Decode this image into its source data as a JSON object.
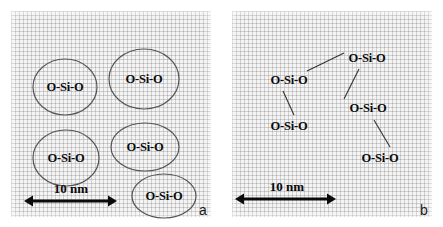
{
  "figure": {
    "panels": [
      {
        "id": "a",
        "letter": "a",
        "letter_pos": {
          "x": 188,
          "y": 192
        },
        "type": "clustered-aggregates",
        "scalebar": {
          "label": "10 nm",
          "x1": 13,
          "x2": 106,
          "y": 190,
          "text_x": 60,
          "text_y": 170
        },
        "ellipses": [
          {
            "label": "O-Si-O",
            "cx": 54,
            "cy": 76,
            "rx": 32,
            "ry": 28
          },
          {
            "label": "O-Si-O",
            "cx": 133,
            "cy": 68,
            "rx": 35,
            "ry": 30
          },
          {
            "label": "O-Si-O",
            "cx": 55,
            "cy": 147,
            "rx": 33,
            "ry": 28
          },
          {
            "label": "O-Si-O",
            "cx": 134,
            "cy": 136,
            "rx": 34,
            "ry": 24
          },
          {
            "label": "O-Si-O",
            "cx": 153,
            "cy": 185,
            "rx": 32,
            "ry": 22
          }
        ],
        "links": []
      },
      {
        "id": "b",
        "letter": "b",
        "letter_pos": {
          "x": 188,
          "y": 192
        },
        "type": "dispersed-chain",
        "scalebar": {
          "label": "10 nm",
          "x1": 3,
          "x2": 104,
          "y": 188,
          "text_x": 55,
          "text_y": 168
        },
        "nodes": [
          {
            "id": "n1",
            "label": "O-Si-O",
            "cx": 57,
            "cy": 69
          },
          {
            "id": "n2",
            "label": "O-Si-O",
            "cx": 135,
            "cy": 47
          },
          {
            "id": "n3",
            "label": "O-Si-O",
            "cx": 57,
            "cy": 115
          },
          {
            "id": "n4",
            "label": "O-Si-O",
            "cx": 136,
            "cy": 97
          },
          {
            "id": "n5",
            "label": "O-Si-O",
            "cx": 148,
            "cy": 147
          }
        ],
        "links": [
          {
            "from": "n1",
            "to": "n2",
            "x1": 75,
            "y1": 60,
            "x2": 112,
            "y2": 42
          },
          {
            "from": "n1",
            "to": "n3",
            "x1": 51,
            "y1": 80,
            "x2": 62,
            "y2": 104
          },
          {
            "from": "n2",
            "to": "n4",
            "x1": 127,
            "y1": 58,
            "x2": 112,
            "y2": 88
          },
          {
            "from": "n4",
            "to": "n5",
            "x1": 142,
            "y1": 109,
            "x2": 158,
            "y2": 136
          }
        ]
      }
    ]
  },
  "colors": {
    "ink": "#0a0a0a",
    "ellipse_stroke": "#555555",
    "link_stroke": "#333333",
    "panel_background": "#f4f4f4"
  }
}
